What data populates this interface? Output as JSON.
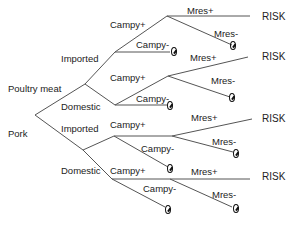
{
  "diagram": {
    "type": "event-tree",
    "root_labels": {
      "poultry": "Poultry meat",
      "pork": "Pork"
    },
    "origin_labels": {
      "poultry_imported": "Imported",
      "poultry_domestic": "Domestic",
      "pork_imported": "Imported",
      "pork_domestic": "Domestic"
    },
    "campy_labels": {
      "pi_pos": "Campy+",
      "pi_neg": "Campy-",
      "pd_pos": "Campy+",
      "pd_neg": "Campy-",
      "ki_pos": "Campy+",
      "ki_neg": "Campy-",
      "kd_pos": "Campy+",
      "kd_neg": "Campy-"
    },
    "mres_labels": {
      "pi_pos": "Mres+",
      "pi_neg": "Mres-",
      "pd_pos": "Mres+",
      "pd_neg": "Mres-",
      "ki_pos": "Mres+",
      "ki_neg": "Mres-",
      "kd_pos": "Mres+",
      "kd_neg": "Mres-"
    },
    "outcomes": {
      "risk1": "RISK",
      "risk2": "RISK",
      "risk3": "RISK",
      "risk4": "RISK"
    },
    "terminal_symbol": "null-set",
    "line_color": "#555555"
  }
}
